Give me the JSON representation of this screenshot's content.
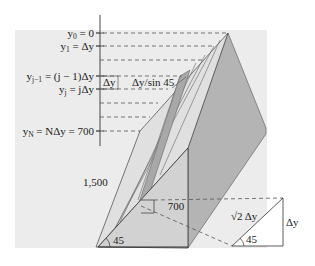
{
  "figure": {
    "colors": {
      "backdrop": "#ececec",
      "strip_light": "#e2e2e2",
      "strip_mid": "#cfcfcf",
      "strip_dark": "#a9a9a9",
      "face_dark": "#b4b4b4",
      "triangle_face": "#d3d3d3",
      "line": "#333333",
      "dash": "#555555"
    }
  },
  "axis_labels": {
    "y0": {
      "var": "y",
      "sub": "0",
      "rest": " = 0"
    },
    "y1": {
      "var": "y",
      "sub": "1",
      "rest": " = Δy"
    },
    "yj_minus_1": {
      "var": "y",
      "sub": "j−1",
      "rest": " = (j − 1)Δy"
    },
    "yj": {
      "var": "y",
      "sub": "j",
      "rest": " = jΔy"
    },
    "yN": {
      "var": "y",
      "sub": "N",
      "rest": " = NΔy = 700"
    }
  },
  "annotations": {
    "delta_y_box": "Δy",
    "strip_length": "Δy/sin 45",
    "slant_length": "1,500",
    "height": "700",
    "base_angle": "45",
    "inset_hypotenuse": "√2 Δy",
    "inset_side": "Δy",
    "inset_angle": "45"
  }
}
